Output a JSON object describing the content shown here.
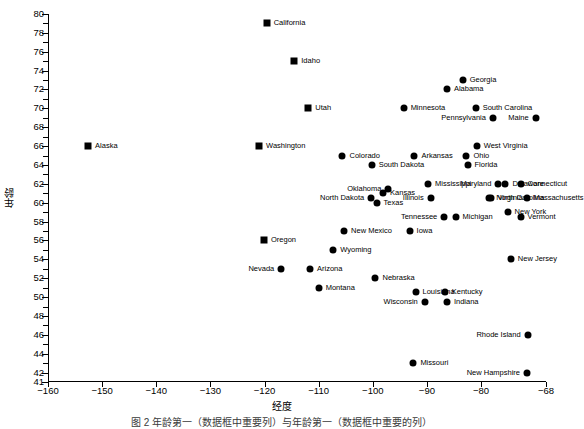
{
  "chart_data": {
    "type": "scatter",
    "title": "",
    "xlabel": "经度",
    "ylabel": "年龄",
    "xlim": [
      -160,
      -68
    ],
    "ylim": [
      41,
      80
    ],
    "grid": false,
    "legend": "none",
    "xticks": [
      -160,
      -150,
      -140,
      -130,
      -120,
      -110,
      -100,
      -90,
      -80,
      -68
    ],
    "yticks": [
      41,
      42,
      44,
      46,
      48,
      50,
      52,
      54,
      56,
      58,
      60,
      62,
      64,
      66,
      68,
      70,
      72,
      74,
      76,
      78,
      80
    ],
    "ytick_labels": [
      "41",
      "42",
      "44",
      "46",
      "48",
      "50",
      "52",
      "54",
      "56",
      "58",
      "60",
      "62",
      "64",
      "66",
      "68",
      "70",
      "72",
      "74",
      "76",
      "78",
      "80"
    ],
    "xtick_labels": [
      "-160",
      "-150",
      "-140",
      "-130",
      "-120",
      "-110",
      "-100",
      "-90",
      "-80",
      "-68"
    ],
    "points": [
      {
        "label": "California",
        "x": -119.6,
        "y": 79.0,
        "marker": "square",
        "side": "right"
      },
      {
        "label": "Idaho",
        "x": -114.5,
        "y": 75.0,
        "marker": "square",
        "side": "right"
      },
      {
        "label": "Georgia",
        "x": -83.4,
        "y": 73.0,
        "marker": "circle",
        "side": "right"
      },
      {
        "label": "Alabama",
        "x": -86.3,
        "y": 72.0,
        "marker": "circle",
        "side": "right"
      },
      {
        "label": "Utah",
        "x": -111.9,
        "y": 70.0,
        "marker": "square",
        "side": "right"
      },
      {
        "label": "Minnesota",
        "x": -94.3,
        "y": 70.0,
        "marker": "circle",
        "side": "right"
      },
      {
        "label": "South Carolina",
        "x": -81.0,
        "y": 70.0,
        "marker": "circle",
        "side": "right"
      },
      {
        "label": "Pennsylvania",
        "x": -77.8,
        "y": 69.0,
        "marker": "circle",
        "side": "left"
      },
      {
        "label": "Maine",
        "x": -69.9,
        "y": 69.0,
        "marker": "circle",
        "side": "left"
      },
      {
        "label": "Alaska",
        "x": -152.6,
        "y": 66.0,
        "marker": "square",
        "side": "right"
      },
      {
        "label": "Washington",
        "x": -121.0,
        "y": 66.0,
        "marker": "square",
        "side": "right"
      },
      {
        "label": "West Virginia",
        "x": -80.8,
        "y": 66.0,
        "marker": "circle",
        "side": "right"
      },
      {
        "label": "Colorado",
        "x": -105.6,
        "y": 65.0,
        "marker": "circle",
        "side": "right"
      },
      {
        "label": "Arkansas",
        "x": -92.3,
        "y": 65.0,
        "marker": "circle",
        "side": "right"
      },
      {
        "label": "Ohio",
        "x": -82.7,
        "y": 65.0,
        "marker": "circle",
        "side": "right"
      },
      {
        "label": "South Dakota",
        "x": -100.2,
        "y": 64.0,
        "marker": "circle",
        "side": "right"
      },
      {
        "label": "Florida",
        "x": -82.5,
        "y": 64.0,
        "marker": "circle",
        "side": "right"
      },
      {
        "label": "Mississippi",
        "x": -89.8,
        "y": 62.0,
        "marker": "circle",
        "side": "right"
      },
      {
        "label": "Maryland",
        "x": -76.8,
        "y": 62.0,
        "marker": "circle",
        "side": "left"
      },
      {
        "label": "Delaware",
        "x": -75.5,
        "y": 62.0,
        "marker": "circle",
        "side": "top"
      },
      {
        "label": "Connecticut",
        "x": -72.7,
        "y": 62.0,
        "marker": "circle",
        "side": "top"
      },
      {
        "label": "Oklahoma",
        "x": -97.1,
        "y": 61.5,
        "marker": "circle",
        "side": "left"
      },
      {
        "label": "Kansas",
        "x": -98.1,
        "y": 61.0,
        "marker": "circle",
        "side": "top"
      },
      {
        "label": "North Dakota",
        "x": -100.3,
        "y": 60.5,
        "marker": "circle",
        "side": "left"
      },
      {
        "label": "Illinois",
        "x": -89.3,
        "y": 60.5,
        "marker": "circle",
        "side": "left"
      },
      {
        "label": "North Carolina",
        "x": -78.5,
        "y": 60.5,
        "marker": "circle",
        "side": "bottom"
      },
      {
        "label": "Virginia",
        "x": -78.2,
        "y": 60.5,
        "marker": "circle",
        "side": "right"
      },
      {
        "label": "Massachusetts",
        "x": -71.6,
        "y": 60.5,
        "marker": "circle",
        "side": "right"
      },
      {
        "label": "Texas",
        "x": -99.3,
        "y": 60.0,
        "marker": "circle",
        "side": "right"
      },
      {
        "label": "New York",
        "x": -75.1,
        "y": 59.0,
        "marker": "circle",
        "side": "right"
      },
      {
        "label": "Tennessee",
        "x": -86.8,
        "y": 58.5,
        "marker": "circle",
        "side": "left"
      },
      {
        "label": "Michigan",
        "x": -84.7,
        "y": 58.5,
        "marker": "circle",
        "side": "right"
      },
      {
        "label": "Vermont",
        "x": -72.7,
        "y": 58.5,
        "marker": "circle",
        "side": "right"
      },
      {
        "label": "New Mexico",
        "x": -105.3,
        "y": 57.0,
        "marker": "circle",
        "side": "right"
      },
      {
        "label": "Iowa",
        "x": -93.2,
        "y": 57.0,
        "marker": "circle",
        "side": "right"
      },
      {
        "label": "Oregon",
        "x": -120.1,
        "y": 56.0,
        "marker": "square",
        "side": "right"
      },
      {
        "label": "Wyoming",
        "x": -107.3,
        "y": 55.0,
        "marker": "circle",
        "side": "right"
      },
      {
        "label": "Nevada",
        "x": -116.9,
        "y": 53.0,
        "marker": "circle",
        "side": "left"
      },
      {
        "label": "Arizona",
        "x": -111.6,
        "y": 53.0,
        "marker": "circle",
        "side": "right"
      },
      {
        "label": "New Jersey",
        "x": -74.5,
        "y": 54.0,
        "marker": "circle",
        "side": "right"
      },
      {
        "label": "Nebraska",
        "x": -99.5,
        "y": 52.0,
        "marker": "circle",
        "side": "right"
      },
      {
        "label": "Montana",
        "x": -110.0,
        "y": 51.0,
        "marker": "circle",
        "side": "right"
      },
      {
        "label": "Louisiana",
        "x": -92.1,
        "y": 50.5,
        "marker": "circle",
        "side": "right"
      },
      {
        "label": "Kentucky",
        "x": -86.7,
        "y": 50.5,
        "marker": "circle",
        "side": "right"
      },
      {
        "label": "Wisconsin",
        "x": -90.4,
        "y": 49.5,
        "marker": "circle",
        "side": "left"
      },
      {
        "label": "Indiana",
        "x": -86.3,
        "y": 49.5,
        "marker": "circle",
        "side": "right"
      },
      {
        "label": "Rhode Island",
        "x": -71.4,
        "y": 46.0,
        "marker": "circle",
        "side": "left"
      },
      {
        "label": "Missouri",
        "x": -92.5,
        "y": 43.0,
        "marker": "circle",
        "side": "right"
      },
      {
        "label": "New Hampshire",
        "x": -71.5,
        "y": 42.0,
        "marker": "circle",
        "side": "left"
      }
    ]
  },
  "figure": {
    "xlabel": "经度",
    "ylabel": "年龄",
    "caption": "图 2  年龄第一（数据框中重要列）与年龄第一（数据框中重要的列）"
  }
}
